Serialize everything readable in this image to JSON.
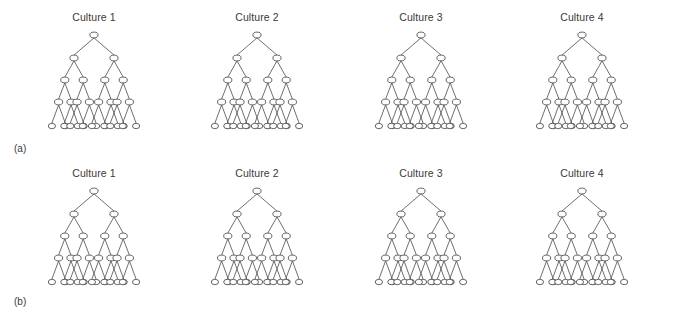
{
  "figure": {
    "width": 674,
    "height": 316,
    "background": "#ffffff",
    "line_color": "#555555",
    "node_stroke_color": "#4a4a4a",
    "node_fill_color": "#ffffff",
    "text_color": "#3a3a3a"
  },
  "panels": [
    {
      "id": "a",
      "label": "(a)",
      "label_x": 14,
      "label_y": 152,
      "top": 6,
      "trees": [
        {
          "title": "Culture 1",
          "center_x": 94,
          "title_y": 21
        },
        {
          "title": "Culture 2",
          "center_x": 257,
          "title_y": 21
        },
        {
          "title": "Culture 3",
          "center_x": 421,
          "title_y": 21
        },
        {
          "title": "Culture 4",
          "center_x": 582,
          "title_y": 21
        }
      ]
    },
    {
      "id": "b",
      "label": "(b)",
      "label_x": 14,
      "label_y": 305,
      "top": 162,
      "trees": [
        {
          "title": "Culture 1",
          "center_x": 94,
          "title_y": 177
        },
        {
          "title": "Culture 2",
          "center_x": 257,
          "title_y": 177
        },
        {
          "title": "Culture 3",
          "center_x": 421,
          "title_y": 177
        },
        {
          "title": "Culture 4",
          "center_x": 582,
          "title_y": 177
        }
      ]
    }
  ],
  "tree_structure": {
    "description": "balanced binary tree, 5 levels",
    "levels": 5,
    "branching_factor": 2,
    "nodes_per_level": [
      1,
      2,
      4,
      8,
      16
    ],
    "total_nodes": 31,
    "leaf_count": 16,
    "level_y_offsets": [
      29,
      52,
      74,
      96,
      120
    ],
    "node_rx": 4.1,
    "node_ry": 2.9,
    "leaf_rx": 3.6,
    "leaf_ry": 2.7,
    "tree_half_width": 76,
    "leaf_span": 75,
    "level_spans": [
      0,
      40,
      56,
      66,
      75
    ]
  },
  "chart_data": {
    "type": "diagram",
    "title": "",
    "subtype": "hierarchical-tree-grid",
    "rows": 2,
    "columns": 4,
    "row_labels": [
      "(a)",
      "(b)"
    ],
    "column_labels": [
      "Culture 1",
      "Culture 2",
      "Culture 3",
      "Culture 4"
    ],
    "tree": {
      "levels": 5,
      "nodes_per_level": [
        1,
        2,
        4,
        8,
        16
      ],
      "branching_factor": 2,
      "total_nodes_per_tree": 31
    }
  }
}
